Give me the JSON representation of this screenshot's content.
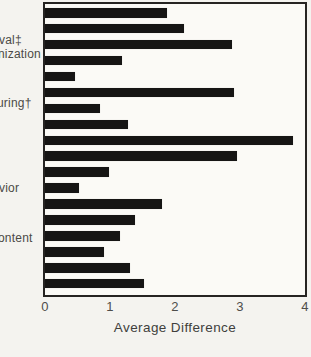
{
  "chart_data": {
    "type": "bar",
    "orientation": "horizontal",
    "title": "",
    "xlabel": "Average Difference",
    "ylabel": "",
    "xlim": [
      0,
      4
    ],
    "x_ticks": [
      "0",
      "1",
      "2",
      "3",
      "4"
    ],
    "grid": false,
    "bar_color": "#161514",
    "values": [
      1.88,
      2.14,
      2.87,
      1.18,
      0.46,
      2.9,
      0.85,
      1.27,
      3.82,
      2.95,
      0.98,
      0.52,
      1.8,
      1.39,
      1.16,
      0.9,
      1.3,
      1.53
    ],
    "side_labels": [
      {
        "text": "val‡"
      },
      {
        "text": "nization"
      },
      {
        "text": "uring†"
      },
      {
        "text": "vior"
      },
      {
        "text": "ontent"
      }
    ]
  }
}
